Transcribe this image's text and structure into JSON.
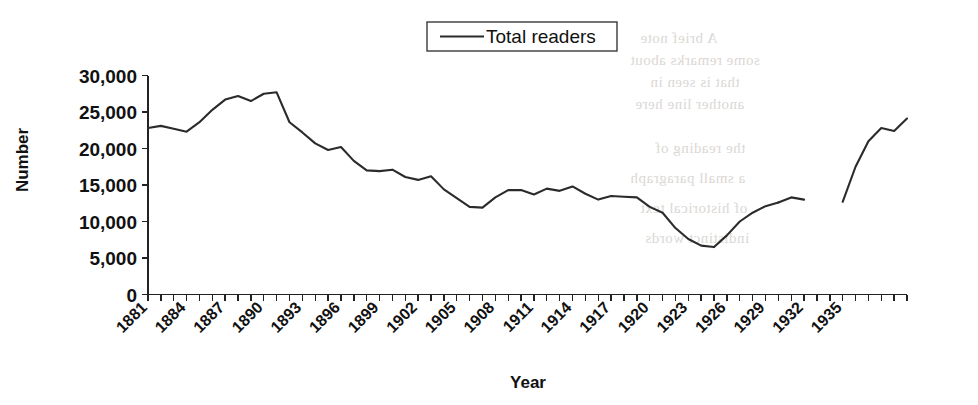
{
  "chart_data": {
    "type": "line",
    "title": "",
    "xlabel": "Year",
    "ylabel": "Number",
    "ylim": [
      0,
      30000
    ],
    "xlim": [
      1881,
      1940
    ],
    "grid": false,
    "legend_position": "top-center",
    "y_ticks": [
      0,
      5000,
      10000,
      15000,
      20000,
      25000,
      30000
    ],
    "y_tick_labels": [
      "0",
      "5,000",
      "10,000",
      "15,000",
      "20,000",
      "25,000",
      "30,000"
    ],
    "x_tick_years": [
      1881,
      1882,
      1883,
      1884,
      1885,
      1886,
      1887,
      1888,
      1889,
      1890,
      1891,
      1892,
      1893,
      1894,
      1895,
      1896,
      1897,
      1898,
      1899,
      1900,
      1901,
      1902,
      1903,
      1904,
      1905,
      1906,
      1907,
      1908,
      1909,
      1910,
      1911,
      1912,
      1913,
      1914,
      1915,
      1916,
      1917,
      1918,
      1919,
      1920,
      1921,
      1922,
      1923,
      1924,
      1925,
      1926,
      1927,
      1928,
      1929,
      1930,
      1931,
      1932,
      1933,
      1934,
      1935,
      1936,
      1937,
      1938,
      1939,
      1940
    ],
    "x_tick_labels": [
      "1881",
      "1884",
      "1887",
      "1890",
      "1893",
      "1896",
      "1899",
      "1902",
      "1905",
      "1908",
      "1911",
      "1914",
      "1917",
      "1920",
      "1923",
      "1926",
      "1929",
      "1932",
      "1935"
    ],
    "x_tick_label_years": [
      1881,
      1884,
      1887,
      1890,
      1893,
      1896,
      1899,
      1902,
      1905,
      1908,
      1911,
      1914,
      1917,
      1920,
      1923,
      1926,
      1929,
      1932,
      1935
    ],
    "series": [
      {
        "name": "Total readers",
        "color": "#2b2b2b",
        "x": [
          1881,
          1882,
          1883,
          1884,
          1885,
          1886,
          1887,
          1888,
          1889,
          1890,
          1891,
          1892,
          1893,
          1894,
          1895,
          1896,
          1897,
          1898,
          1899,
          1900,
          1901,
          1902,
          1903,
          1904,
          1905,
          1906,
          1907,
          1908,
          1909,
          1910,
          1911,
          1912,
          1913,
          1914,
          1915,
          1916,
          1917,
          1918,
          1919,
          1920,
          1921,
          1922,
          1923,
          1924,
          1925
        ],
        "values": [
          22800,
          23100,
          22700,
          22300,
          23600,
          25300,
          26700,
          27200,
          26500,
          27500,
          27700,
          23600,
          22200,
          20700,
          19800,
          20200,
          18300,
          17000,
          16900,
          17100,
          16100,
          15700,
          16200,
          14400,
          13200,
          12000,
          11900,
          13300,
          14300,
          14300,
          13700,
          14500,
          14200,
          14800,
          13800,
          13000,
          13500,
          13400,
          13300,
          12000,
          11200,
          9100,
          7600,
          6700,
          6500
        ]
      },
      {
        "name": "Total readers (continued)",
        "color": "#2b2b2b",
        "x": [
          1925,
          1926,
          1927,
          1928,
          1929,
          1930
        ],
        "values": [
          6500,
          8100,
          10000,
          11200,
          12100,
          12600
        ]
      },
      {
        "name": "Total readers (segment 3)",
        "color": "#2b2b2b",
        "x": [
          1930,
          1931,
          1932
        ],
        "values": [
          12600,
          13300,
          13000
        ]
      },
      {
        "name": "Total readers (segment 4)",
        "color": "#2b2b2b",
        "x": [
          1935,
          1936,
          1937,
          1938,
          1939,
          1940
        ],
        "values": [
          12700,
          17500,
          21000,
          22800,
          22400,
          24100
        ]
      }
    ]
  },
  "legend": {
    "label": "Total readers"
  },
  "axes": {
    "y_title": "Number",
    "x_title": "Year"
  },
  "bleed_text": [
    "A brief note",
    "some remarks about",
    "that is seen in",
    "another line here",
    "the reading of",
    "a small paragraph",
    "of historical text",
    "indistinct words"
  ]
}
